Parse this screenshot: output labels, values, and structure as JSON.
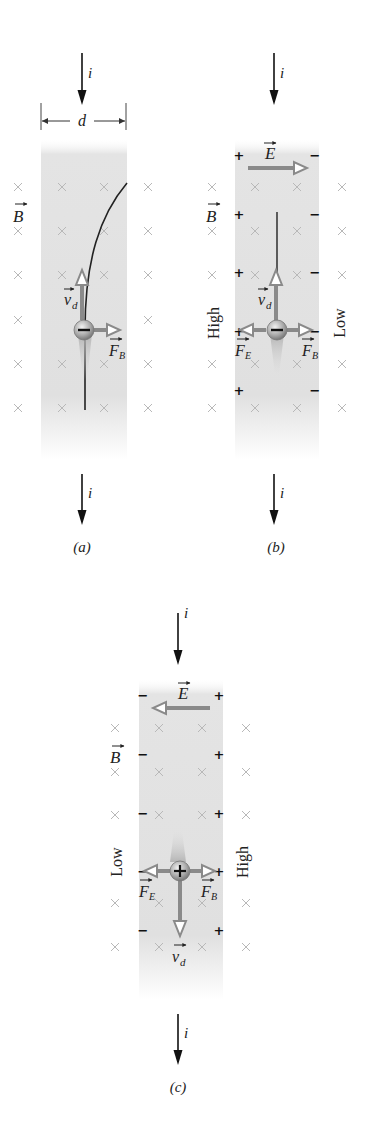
{
  "figure": {
    "panels": [
      {
        "id": "a",
        "caption": "(a)",
        "current_label": "i",
        "width_label": "d",
        "field_label": "B",
        "velocity_label": "v",
        "velocity_sub": "d",
        "force_b_label": "F",
        "force_b_sub": "B",
        "carrier_sign": "−",
        "carrier": "electron (negative)",
        "trajectory": "curves to the right"
      },
      {
        "id": "b",
        "caption": "(b)",
        "current_label": "i",
        "field_label": "B",
        "efield_label": "E",
        "efield_direction": "right",
        "velocity_label": "v",
        "velocity_sub": "d",
        "force_e_label": "F",
        "force_e_sub": "E",
        "force_b_label": "F",
        "force_b_sub": "B",
        "left_potential": "High",
        "right_potential": "Low",
        "left_edge_charge": "+",
        "right_edge_charge": "−",
        "carrier_sign": "−"
      },
      {
        "id": "c",
        "caption": "(c)",
        "current_label": "i",
        "field_label": "B",
        "efield_label": "E",
        "efield_direction": "left",
        "velocity_label": "v",
        "velocity_sub": "d",
        "force_e_label": "F",
        "force_e_sub": "E",
        "force_b_label": "F",
        "force_b_sub": "B",
        "left_potential": "Low",
        "right_potential": "High",
        "left_edge_charge": "−",
        "right_edge_charge": "+",
        "carrier_sign": "+"
      }
    ],
    "colors": {
      "arrow_gray": "#8a8a8a",
      "strip_gray": "#e2e2e2",
      "xmark_gray": "#b8b8b8",
      "ink": "#111111"
    }
  }
}
